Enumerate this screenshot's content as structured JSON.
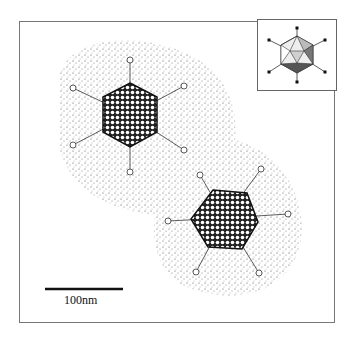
{
  "figure": {
    "scale_bar": {
      "label": "100nm"
    },
    "inset": {
      "description": "Icosahedron model with fibers at vertices"
    },
    "particles": [
      {
        "name": "upper-left-virion",
        "cx": 130,
        "cy": 115
      },
      {
        "name": "lower-right-virion",
        "cx": 225,
        "cy": 225
      }
    ],
    "colors": {
      "frame": "#777777",
      "stipple": "#555555",
      "capsid": "#222222",
      "face_light": "#d8d8d8",
      "face_mid": "#aaaaaa",
      "face_dark": "#555555"
    }
  }
}
